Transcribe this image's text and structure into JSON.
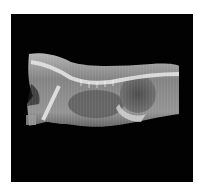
{
  "image": {
    "subject": "lateral radiograph of animal torso",
    "background_color": "#020202",
    "page_color": "#ffffff"
  }
}
